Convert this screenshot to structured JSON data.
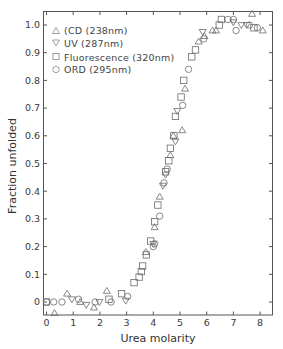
{
  "chart_data": {
    "type": "scatter",
    "title": "",
    "xlabel": "Urea molarity",
    "ylabel": "Fraction unfolded",
    "xlim": [
      -0.12,
      8.55
    ],
    "ylim": [
      -0.048,
      1.048
    ],
    "x_ticks": [
      0,
      1,
      2,
      3,
      4,
      5,
      6,
      7,
      8
    ],
    "x_tick_labels": [
      "0",
      "1",
      "2",
      "3",
      "4",
      "5",
      "6",
      "7",
      "8"
    ],
    "y_ticks": [
      0,
      0.1,
      0.2,
      0.3,
      0.4,
      0.5,
      0.6,
      0.7,
      0.8,
      0.9,
      1.0
    ],
    "y_tick_labels": [
      "0",
      "0.1",
      "0.2",
      "0.3",
      "0.4",
      "0.5",
      "0.6",
      "0.7",
      "0.8",
      "0.9",
      "1.0"
    ],
    "grid": false,
    "legend_position": "upper left",
    "series": [
      {
        "name": "(CD (238nm)",
        "marker": "triangle-up",
        "points": [
          [
            0.3,
            -0.04
          ],
          [
            0.77,
            0.03
          ],
          [
            1.26,
            0.0
          ],
          [
            1.78,
            -0.02
          ],
          [
            2.26,
            0.04
          ],
          [
            3.72,
            0.18
          ],
          [
            4.05,
            0.27
          ],
          [
            4.24,
            0.38
          ],
          [
            4.64,
            0.53
          ],
          [
            4.75,
            0.6
          ],
          [
            5.08,
            0.62
          ],
          [
            5.19,
            0.77
          ],
          [
            5.7,
            0.94
          ],
          [
            5.91,
            0.96
          ],
          [
            6.22,
            0.98
          ],
          [
            6.35,
            0.98
          ],
          [
            7.7,
            1.04
          ],
          [
            8.1,
            0.98
          ]
        ]
      },
      {
        "name": "UV (287nm)",
        "marker": "triangle-down",
        "points": [
          [
            0.95,
            0.01
          ],
          [
            1.49,
            -0.01
          ],
          [
            1.98,
            0.0
          ],
          [
            2.97,
            0.005
          ],
          [
            4.0,
            0.21
          ],
          [
            4.36,
            0.42
          ],
          [
            4.46,
            0.46
          ],
          [
            4.83,
            0.58
          ],
          [
            4.9,
            0.69
          ],
          [
            5.85,
            0.975
          ],
          [
            7.0,
            1.01
          ],
          [
            7.3,
            1.0
          ],
          [
            7.5,
            1.0
          ]
        ]
      },
      {
        "name": "Fluorescence (320nm)",
        "marker": "square",
        "points": [
          [
            0,
            0.0
          ],
          [
            2.34,
            0.01
          ],
          [
            2.81,
            0.03
          ],
          [
            3.28,
            0.07
          ],
          [
            3.47,
            0.09
          ],
          [
            3.55,
            0.11
          ],
          [
            3.6,
            0.13
          ],
          [
            3.74,
            0.17
          ],
          [
            3.9,
            0.22
          ],
          [
            4.05,
            0.29
          ],
          [
            4.17,
            0.35
          ],
          [
            4.46,
            0.47
          ],
          [
            4.58,
            0.51
          ],
          [
            4.64,
            0.555
          ],
          [
            4.77,
            0.6
          ],
          [
            4.83,
            0.67
          ],
          [
            5.04,
            0.74
          ],
          [
            5.14,
            0.8
          ],
          [
            5.44,
            0.885
          ],
          [
            5.58,
            0.91
          ],
          [
            6.47,
            1.0
          ],
          [
            6.55,
            1.02
          ],
          [
            7.77,
            0.99
          ]
        ]
      },
      {
        "name": "ORD (295nm)",
        "marker": "circle",
        "points": [
          [
            0,
            0.0
          ],
          [
            0.27,
            0.0
          ],
          [
            0.58,
            0.0
          ],
          [
            1.2,
            0.01
          ],
          [
            1.82,
            0.0
          ],
          [
            2.42,
            0.0
          ],
          [
            3.04,
            0.02
          ],
          [
            4.0,
            0.2
          ],
          [
            4.05,
            0.21
          ],
          [
            4.24,
            0.31
          ],
          [
            4.4,
            0.43
          ],
          [
            4.52,
            0.48
          ],
          [
            5.1,
            0.71
          ],
          [
            5.32,
            0.84
          ],
          [
            5.89,
            0.95
          ],
          [
            6.8,
            1.02
          ],
          [
            7.0,
            1.02
          ],
          [
            7.1,
            0.98
          ],
          [
            7.6,
            1.0
          ],
          [
            7.9,
            0.99
          ]
        ]
      }
    ]
  },
  "colors": {
    "axis": "#555555",
    "marker_stroke": "#6a6a6a",
    "text": "#3a3a3a",
    "background": "#ffffff"
  }
}
